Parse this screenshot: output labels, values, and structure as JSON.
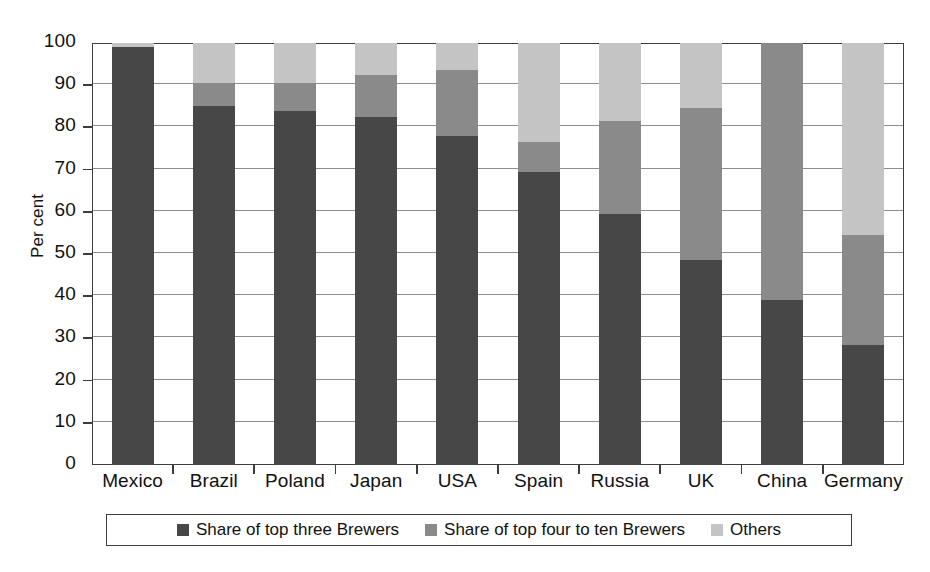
{
  "chart_data": {
    "type": "bar",
    "subtype": "stacked-bar",
    "title": "",
    "xlabel": "",
    "ylabel": "Per cent",
    "ylim": [
      0,
      100
    ],
    "ytick_step": 10,
    "yticks": [
      0,
      10,
      20,
      30,
      40,
      50,
      60,
      70,
      80,
      90,
      100
    ],
    "ytick_labels": [
      "0",
      "10",
      "20",
      "30",
      "40",
      "50",
      "60",
      "70",
      "80",
      "90",
      "100"
    ],
    "grid": true,
    "grid_axis": "y",
    "legend_position": "bottom",
    "categories": [
      "Mexico",
      "Brazil",
      "Poland",
      "Japan",
      "USA",
      "Spain",
      "Russia",
      "UK",
      "China",
      "Germany"
    ],
    "series": [
      {
        "name": "Share of top three Brewers",
        "color": "#474747",
        "values": [
          99.0,
          85.0,
          84.0,
          82.5,
          78.0,
          69.5,
          59.5,
          48.5,
          39.0,
          28.5
        ]
      },
      {
        "name": "Share of top four to ten Brewers",
        "color": "#8a8a8a",
        "values": [
          0.0,
          5.5,
          6.5,
          10.0,
          15.5,
          7.0,
          22.0,
          36.0,
          61.0,
          26.0
        ]
      },
      {
        "name": "Others",
        "color": "#c4c4c4",
        "values": [
          1.0,
          9.5,
          9.5,
          7.5,
          6.5,
          23.5,
          18.5,
          15.5,
          0.0,
          45.5
        ]
      }
    ],
    "cumulative_tops": [
      {
        "category": "Mexico",
        "top_three": 99.0,
        "top_four_to_ten": 99.0,
        "total": 100.0
      },
      {
        "category": "Brazil",
        "top_three": 85.0,
        "top_four_to_ten": 90.5,
        "total": 100.0
      },
      {
        "category": "Poland",
        "top_three": 84.0,
        "top_four_to_ten": 90.5,
        "total": 100.0
      },
      {
        "category": "Japan",
        "top_three": 82.5,
        "top_four_to_ten": 92.5,
        "total": 100.0
      },
      {
        "category": "USA",
        "top_three": 78.0,
        "top_four_to_ten": 93.5,
        "total": 100.0
      },
      {
        "category": "Spain",
        "top_three": 69.5,
        "top_four_to_ten": 76.5,
        "total": 100.0
      },
      {
        "category": "Russia",
        "top_three": 59.5,
        "top_four_to_ten": 81.5,
        "total": 100.0
      },
      {
        "category": "UK",
        "top_three": 48.5,
        "top_four_to_ten": 84.5,
        "total": 100.0
      },
      {
        "category": "China",
        "top_three": 39.0,
        "top_four_to_ten": 100.0,
        "total": 100.0
      },
      {
        "category": "Germany",
        "top_three": 28.5,
        "top_four_to_ten": 54.5,
        "total": 100.0
      }
    ]
  },
  "axis": {
    "y_title": "Per cent"
  },
  "legend": {
    "items": [
      {
        "label": "Share of top three Brewers",
        "color": "#474747"
      },
      {
        "label": "Share of top four to ten Brewers",
        "color": "#8a8a8a"
      },
      {
        "label": "Others",
        "color": "#c4c4c4"
      }
    ]
  },
  "colors": {
    "dark": "#474747",
    "mid": "#8a8a8a",
    "light": "#c4c4c4",
    "axis": "#3d3d3d",
    "grid": "#8e8e8e",
    "background": "#ffffff"
  }
}
